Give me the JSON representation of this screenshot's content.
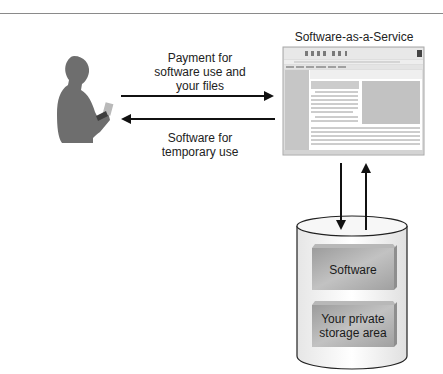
{
  "diagram": {
    "title": "Software-as-a-Service",
    "user": {
      "icon": "person-with-phone-icon"
    },
    "arrows": [
      {
        "id": "to-service",
        "direction": "right",
        "label_lines": [
          "Payment for",
          "software use and",
          "your files"
        ]
      },
      {
        "id": "to-user",
        "direction": "left",
        "label_lines": [
          "Software for",
          "temporary use"
        ]
      },
      {
        "id": "to-storage",
        "direction": "down",
        "label_lines": []
      },
      {
        "id": "from-storage",
        "direction": "up",
        "label_lines": []
      }
    ],
    "service_window": {
      "icon": "browser-window-icon"
    },
    "storage": {
      "icon": "database-cylinder-icon",
      "boxes": [
        {
          "label_lines": [
            "Software"
          ]
        },
        {
          "label_lines": [
            "Your private",
            "storage area"
          ]
        }
      ]
    },
    "colors": {
      "person": "#6e6e6e",
      "arrow": "#111111",
      "window_frame": "#d8d8d8",
      "window_panel": "#c4c4c4",
      "cylinder_fill": "#f2f2f2",
      "box_fill": "#a8a8a8"
    }
  }
}
